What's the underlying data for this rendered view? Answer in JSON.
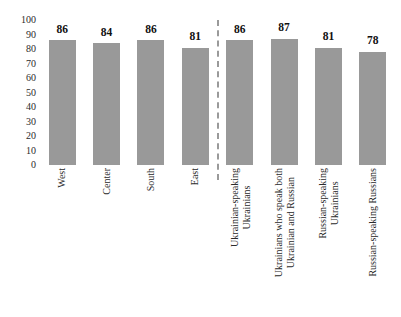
{
  "chart_data": {
    "type": "bar",
    "title": "",
    "subtitle": "",
    "xlabel": "",
    "ylabel": "",
    "ylim": [
      0,
      100
    ],
    "yticks": [
      100,
      90,
      80,
      70,
      60,
      50,
      40,
      30,
      20,
      10,
      0
    ],
    "grid": false,
    "legend": null,
    "bar_color": "#999999",
    "divider": {
      "after_category_index": 3,
      "style": "dashed",
      "color": "#9a9a9a",
      "orientation": "vertical"
    },
    "categories": [
      "West",
      "Center",
      "South",
      "East",
      "Ukrainian-speaking Ukrainians",
      "Ukrainians who speak both Ukrainian and Russian",
      "Russian-speaking Ukrainians",
      "Russian-speaking Russians"
    ],
    "category_lines": [
      [
        "West"
      ],
      [
        "Center"
      ],
      [
        "South"
      ],
      [
        "East"
      ],
      [
        "Ukrainian-speaking",
        "Ukrainians"
      ],
      [
        "Ukrainians who speak both",
        "Ukrainian and Russian"
      ],
      [
        "Russian-speaking",
        "Ukrainians"
      ],
      [
        "Russian-speaking Russians"
      ]
    ],
    "values": [
      86,
      84,
      86,
      81,
      86,
      87,
      81,
      78
    ],
    "data_labels": [
      "86",
      "84",
      "86",
      "81",
      "86",
      "87",
      "81",
      "78"
    ]
  }
}
